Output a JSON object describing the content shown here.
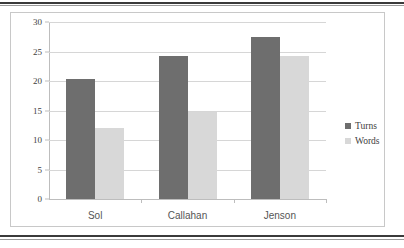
{
  "chart_data": {
    "type": "bar",
    "title": "",
    "subtitle": "",
    "xlabel": "",
    "ylabel": "",
    "categories": [
      "Sol",
      "Callahan",
      "Jenson"
    ],
    "series": [
      {
        "name": "Turns",
        "color": "#6e6e6e",
        "values": [
          20.3,
          24.2,
          27.4
        ]
      },
      {
        "name": "Words",
        "color": "#d8d8d8",
        "values": [
          12.1,
          14.7,
          24.3
        ]
      }
    ],
    "yticks": [
      0,
      5,
      10,
      15,
      20,
      25,
      30
    ],
    "ytick_labels": [
      "0",
      "5",
      "10",
      "15",
      "20",
      "25",
      "30"
    ],
    "ylim": [
      0,
      30
    ],
    "grid": true,
    "grid_axis": "y",
    "legend": [
      "Turns",
      "Words"
    ],
    "legend_position": "right",
    "annotations": []
  },
  "colors": {
    "series_turns": "#6e6e6e",
    "series_words": "#d8d8d8",
    "gridline": "#d6d6d6",
    "axis": "#bdbdbd",
    "frame_border": "#c8c8c8",
    "scan_rule": "#3a3a3a",
    "text": "#3d3d3d",
    "category_text": "#555555",
    "background": "#ffffff"
  }
}
